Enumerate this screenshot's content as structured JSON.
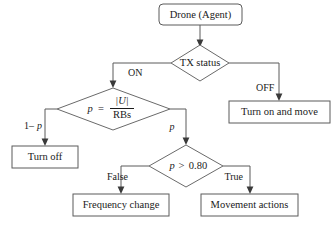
{
  "diagram": {
    "colors": {
      "background": "#ffffff",
      "box_stroke": "#5b5b5b",
      "diamond_stroke": "#6a6a6a",
      "connector": "#5b5b5b",
      "arrow_fill": "#3a3a3a",
      "text": "#1a1a1a"
    },
    "nodes": {
      "start": {
        "label": "Drone (Agent)",
        "shape": "rounded-rectangle"
      },
      "tx_status": {
        "label": "TX status",
        "shape": "diamond"
      },
      "turn_on_and_move": {
        "label": "Turn on and move",
        "shape": "rectangle"
      },
      "p_formula": {
        "shape": "diamond",
        "lhs": "p",
        "equals": "=",
        "numerator": "|U|",
        "denominator": "RBs",
        "label": "p = |U| / RBs"
      },
      "turn_off": {
        "label": "Turn off",
        "shape": "rectangle"
      },
      "p_threshold": {
        "shape": "diamond",
        "variable": "p",
        "operator": ">",
        "threshold": "0.80",
        "label": "p > 0.80"
      },
      "frequency_change": {
        "label": "Frequency change",
        "shape": "rectangle"
      },
      "movement_actions": {
        "label": "Movement actions",
        "shape": "rectangle"
      }
    },
    "edge_labels": {
      "on": "ON",
      "off": "OFF",
      "one_minus_p": "1–p",
      "one_minus_p_prefix": "1–",
      "one_minus_p_var": "p",
      "p": "p",
      "false": "False",
      "true": "True"
    },
    "edges": [
      {
        "from": "start",
        "to": "tx_status",
        "label": ""
      },
      {
        "from": "tx_status",
        "to": "p_formula",
        "label": "ON"
      },
      {
        "from": "tx_status",
        "to": "turn_on_and_move",
        "label": "OFF"
      },
      {
        "from": "p_formula",
        "to": "turn_off",
        "label": "1–p"
      },
      {
        "from": "p_formula",
        "to": "p_threshold",
        "label": "p"
      },
      {
        "from": "p_threshold",
        "to": "frequency_change",
        "label": "False"
      },
      {
        "from": "p_threshold",
        "to": "movement_actions",
        "label": "True"
      }
    ]
  }
}
